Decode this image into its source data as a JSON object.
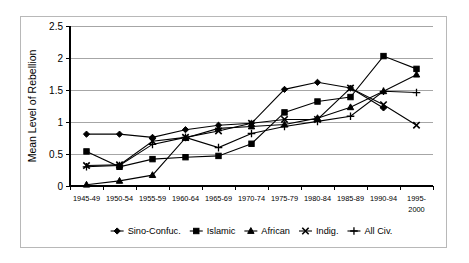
{
  "chart_data": {
    "type": "line",
    "title": "",
    "xlabel": "",
    "ylabel": "Mean Level of Rebellion",
    "ylim": [
      0,
      2.5
    ],
    "yticks": [
      "0",
      "0.5",
      "1",
      "1.5",
      "2",
      "2.5"
    ],
    "ytick_values": [
      0,
      0.5,
      1,
      1.5,
      2,
      2.5
    ],
    "grid": true,
    "legend_position": "bottom",
    "categories": [
      "1945-49",
      "1950-54",
      "1955-59",
      "1960-64",
      "1965-69",
      "1970-74",
      "1975-79",
      "1980-84",
      "1985-89",
      "1990-94",
      "1995-2000"
    ],
    "categories_display": [
      [
        "1945-49"
      ],
      [
        "1950-54"
      ],
      [
        "1955-59"
      ],
      [
        "1960-64"
      ],
      [
        "1965-69"
      ],
      [
        "1970-74"
      ],
      [
        "1975-79"
      ],
      [
        "1980-84"
      ],
      [
        "1985-89"
      ],
      [
        "1990-94"
      ],
      [
        "1995-",
        "2000"
      ]
    ],
    "series": [
      {
        "name": "Sino-Confuc.",
        "marker": "diamond",
        "values": [
          0.81,
          0.81,
          0.76,
          0.88,
          0.95,
          0.98,
          1.51,
          1.62,
          1.53,
          1.22,
          null
        ]
      },
      {
        "name": "Islamic",
        "marker": "square",
        "values": [
          0.54,
          0.3,
          0.42,
          0.45,
          0.47,
          0.66,
          1.15,
          1.32,
          1.39,
          2.03,
          1.83
        ]
      },
      {
        "name": "African",
        "marker": "triangle",
        "values": [
          0.02,
          0.08,
          0.17,
          0.75,
          0.9,
          0.93,
          0.96,
          1.06,
          1.23,
          1.48,
          1.74
        ]
      },
      {
        "name": "Indig.",
        "marker": "x",
        "values": [
          0.32,
          0.33,
          0.7,
          0.76,
          0.86,
          0.98,
          1.04,
          1.04,
          1.53,
          1.27,
          0.95
        ]
      },
      {
        "name": "All Civ.",
        "marker": "plus",
        "values": [
          0.3,
          0.32,
          0.65,
          0.76,
          0.6,
          0.82,
          0.93,
          1.01,
          1.09,
          1.48,
          1.46
        ]
      }
    ]
  },
  "legend": {
    "items": [
      {
        "label": "Sino-Confuc.",
        "marker": "diamond"
      },
      {
        "label": "Islamic",
        "marker": "square"
      },
      {
        "label": "African",
        "marker": "triangle"
      },
      {
        "label": "Indig.",
        "marker": "x"
      },
      {
        "label": "All Civ.",
        "marker": "plus"
      }
    ]
  },
  "colors": {
    "series": "#000000",
    "grid": "#a6a6a6",
    "axis": "#000000",
    "frame": "#b8b8b8",
    "background": "#ffffff"
  }
}
